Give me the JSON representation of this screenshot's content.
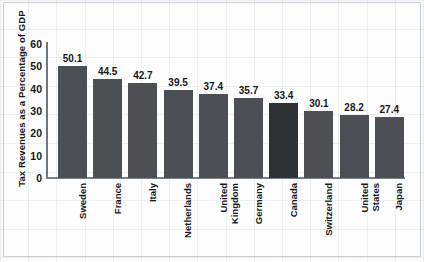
{
  "chart_data": {
    "type": "bar",
    "title": "",
    "xlabel": "",
    "ylabel": "Tax Revenues as a Percentage of GDP",
    "ylim": [
      0,
      60
    ],
    "yticks": [
      60,
      50,
      40,
      30,
      20,
      10,
      0
    ],
    "grid": false,
    "legend": "none",
    "highlight_category": "Canada",
    "colors": {
      "bar": "#4c4f54",
      "bar_highlight": "#2e3135",
      "text": "#15181c",
      "axis": "#7a8089",
      "background": "#fdfdfd"
    },
    "categories": [
      "Sweden",
      "France",
      "Italy",
      "Netherlands",
      "United\nKingdom",
      "Germany",
      "Canada",
      "Switzerland",
      "United\nStates",
      "Japan"
    ],
    "values": [
      50.1,
      44.5,
      42.7,
      39.5,
      37.4,
      35.7,
      33.4,
      30.1,
      28.2,
      27.4
    ],
    "value_labels": [
      "50.1",
      "44.5",
      "42.7",
      "39.5",
      "37.4",
      "35.7",
      "33.4",
      "30.1",
      "28.2",
      "27.4"
    ]
  }
}
